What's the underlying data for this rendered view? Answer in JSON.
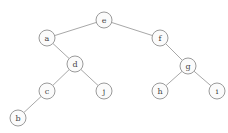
{
  "diagram": {
    "type": "binary-tree",
    "style": {
      "node_radius": 8,
      "node_fill": "#fbfbfb",
      "node_stroke": "#9a9a9a",
      "edge_color": "#a8a8a8",
      "label_color": "#444444"
    },
    "nodes": [
      {
        "id": "e",
        "label": "e",
        "x": 104,
        "y": 20
      },
      {
        "id": "a",
        "label": "a",
        "x": 47,
        "y": 38
      },
      {
        "id": "f",
        "label": "f",
        "x": 160,
        "y": 38
      },
      {
        "id": "d",
        "label": "d",
        "x": 75,
        "y": 64
      },
      {
        "id": "g",
        "label": "g",
        "x": 188,
        "y": 66
      },
      {
        "id": "c",
        "label": "c",
        "x": 47,
        "y": 91
      },
      {
        "id": "j",
        "label": "j",
        "x": 104,
        "y": 91
      },
      {
        "id": "h",
        "label": "h",
        "x": 160,
        "y": 91
      },
      {
        "id": "i",
        "label": "i",
        "x": 217,
        "y": 91
      },
      {
        "id": "b",
        "label": "b",
        "x": 18,
        "y": 118
      }
    ],
    "edges": [
      {
        "from": "e",
        "to": "a"
      },
      {
        "from": "e",
        "to": "f"
      },
      {
        "from": "a",
        "to": "d"
      },
      {
        "from": "f",
        "to": "g"
      },
      {
        "from": "d",
        "to": "c"
      },
      {
        "from": "d",
        "to": "j"
      },
      {
        "from": "g",
        "to": "h"
      },
      {
        "from": "g",
        "to": "i"
      },
      {
        "from": "c",
        "to": "b"
      }
    ]
  }
}
